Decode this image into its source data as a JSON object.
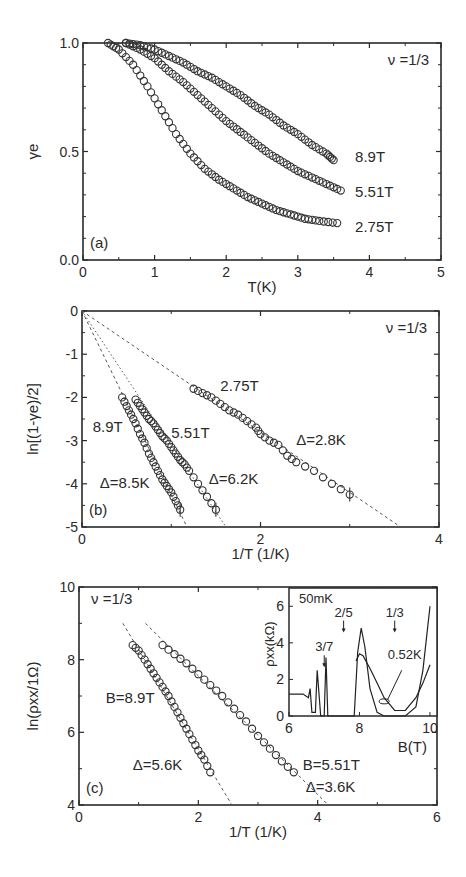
{
  "chart_data": [
    {
      "panel": "(a)",
      "type": "scatter",
      "title": "",
      "annotation": "ν =1/3",
      "xlabel": "T(K)",
      "ylabel": "γe",
      "xlim": [
        0,
        5
      ],
      "ylim": [
        0.0,
        1.0
      ],
      "xticks": [
        "0",
        "1",
        "2",
        "3",
        "4",
        "5"
      ],
      "yticks": [
        "0.0",
        "0.5",
        "1.0"
      ],
      "grid": false,
      "marker": "open-circle",
      "series": [
        {
          "name": "8.9T",
          "x": [
            0.6,
            0.8,
            1.0,
            1.2,
            1.4,
            1.6,
            1.8,
            2.0,
            2.2,
            2.4,
            2.6,
            2.8,
            3.0,
            3.2,
            3.4,
            3.5
          ],
          "y": [
            1.0,
            0.99,
            0.97,
            0.94,
            0.91,
            0.87,
            0.84,
            0.8,
            0.76,
            0.71,
            0.67,
            0.62,
            0.58,
            0.53,
            0.49,
            0.46
          ]
        },
        {
          "name": "5.51T",
          "x": [
            0.6,
            0.8,
            1.0,
            1.2,
            1.4,
            1.6,
            1.8,
            2.0,
            2.2,
            2.4,
            2.6,
            2.8,
            3.0,
            3.2,
            3.4,
            3.6
          ],
          "y": [
            1.0,
            0.97,
            0.93,
            0.87,
            0.82,
            0.76,
            0.7,
            0.64,
            0.59,
            0.54,
            0.49,
            0.45,
            0.41,
            0.38,
            0.35,
            0.32
          ]
        },
        {
          "name": "2.75T",
          "x": [
            0.35,
            0.5,
            0.7,
            0.9,
            1.1,
            1.3,
            1.5,
            1.7,
            1.9,
            2.1,
            2.3,
            2.5,
            2.7,
            2.9,
            3.1,
            3.3,
            3.55
          ],
          "y": [
            1.0,
            0.97,
            0.9,
            0.8,
            0.69,
            0.58,
            0.49,
            0.42,
            0.37,
            0.33,
            0.29,
            0.26,
            0.23,
            0.21,
            0.19,
            0.18,
            0.17
          ]
        }
      ],
      "labels": [
        {
          "text": "8.9T",
          "x": 3.8,
          "y": 0.45
        },
        {
          "text": "5.51T",
          "x": 3.8,
          "y": 0.29
        },
        {
          "text": "2.75T",
          "x": 3.8,
          "y": 0.13
        }
      ],
      "panel_label": "(a)"
    },
    {
      "panel": "(b)",
      "type": "scatter",
      "annotation": "ν =1/3",
      "xlabel": "1/T (1/K)",
      "ylabel": "ln[(1-γe)/2]",
      "xlim": [
        0,
        4
      ],
      "ylim": [
        -5,
        0
      ],
      "xticks": [
        "0",
        "2",
        "4"
      ],
      "yticks": [
        "0",
        "-1",
        "-2",
        "-3",
        "-4",
        "-5"
      ],
      "grid": false,
      "marker": "open-circle",
      "series": [
        {
          "name": "8.9T",
          "x": [
            0.45,
            0.5,
            0.55,
            0.6,
            0.65,
            0.7,
            0.75,
            0.8,
            0.85,
            0.9,
            0.95,
            1.0,
            1.05,
            1.1
          ],
          "y": [
            -2.0,
            -2.2,
            -2.4,
            -2.6,
            -2.85,
            -3.05,
            -3.3,
            -3.5,
            -3.7,
            -3.9,
            -4.05,
            -4.2,
            -4.4,
            -4.6
          ],
          "fit_slope_delta_K": 8.5,
          "fit": "dashed"
        },
        {
          "name": "5.51T",
          "x": [
            0.6,
            0.65,
            0.7,
            0.75,
            0.8,
            0.85,
            0.9,
            0.95,
            1.0,
            1.05,
            1.1,
            1.15,
            1.2,
            1.3,
            1.4,
            1.5
          ],
          "y": [
            -2.05,
            -2.2,
            -2.35,
            -2.5,
            -2.6,
            -2.75,
            -2.9,
            -3.0,
            -3.15,
            -3.3,
            -3.45,
            -3.55,
            -3.7,
            -4.0,
            -4.3,
            -4.6
          ],
          "fit_slope_delta_K": 6.2,
          "fit": "dotted"
        },
        {
          "name": "2.75T",
          "x": [
            1.25,
            1.35,
            1.45,
            1.55,
            1.65,
            1.75,
            1.85,
            1.95,
            2.0,
            2.1,
            2.2,
            2.3,
            2.4,
            2.6,
            2.8,
            3.0
          ],
          "y": [
            -1.8,
            -1.9,
            -2.0,
            -2.15,
            -2.3,
            -2.4,
            -2.55,
            -2.7,
            -2.85,
            -3.0,
            -3.1,
            -3.35,
            -3.5,
            -3.7,
            -4.0,
            -4.25
          ],
          "fit_slope_delta_K": 2.8,
          "fit": "dashed"
        }
      ],
      "labels": [
        {
          "text": "2.75T",
          "x": 1.55,
          "y": -1.85
        },
        {
          "text": "8.9T",
          "x": 0.12,
          "y": -2.8
        },
        {
          "text": "5.51T",
          "x": 1.0,
          "y": -2.95
        },
        {
          "text": "Δ=2.8K",
          "x": 2.4,
          "y": -3.1
        },
        {
          "text": "Δ=6.2K",
          "x": 1.42,
          "y": -4.0
        },
        {
          "text": "Δ=8.5K",
          "x": 0.2,
          "y": -4.1
        }
      ],
      "panel_label": "(b)"
    },
    {
      "panel": "(c)",
      "type": "scatter",
      "annotation": "ν =1/3",
      "xlabel": "1/T (1/K)",
      "ylabel": "ln(ρxx/1Ω)",
      "xlim": [
        0,
        6
      ],
      "ylim": [
        4,
        10
      ],
      "xticks": [
        "0",
        "2",
        "4",
        "6"
      ],
      "yticks": [
        "4",
        "6",
        "8",
        "10"
      ],
      "grid": false,
      "marker": "open-circle",
      "series": [
        {
          "name": "B=8.9T",
          "x": [
            0.9,
            1.0,
            1.1,
            1.2,
            1.3,
            1.4,
            1.5,
            1.6,
            1.7,
            1.8,
            1.9,
            2.0,
            2.1,
            2.2
          ],
          "y": [
            8.4,
            8.25,
            8.0,
            7.75,
            7.5,
            7.25,
            7.0,
            6.7,
            6.4,
            6.1,
            5.8,
            5.5,
            5.25,
            4.9
          ],
          "fit_slope_delta_K": 5.6
        },
        {
          "name": "B=5.51T",
          "x": [
            1.4,
            1.6,
            1.8,
            2.0,
            2.2,
            2.4,
            2.6,
            2.8,
            3.0,
            3.2,
            3.4,
            3.6
          ],
          "y": [
            8.4,
            8.15,
            7.9,
            7.6,
            7.3,
            7.0,
            6.65,
            6.3,
            5.9,
            5.55,
            5.2,
            4.9
          ],
          "fit_slope_delta_K": 3.6
        }
      ],
      "labels": [
        {
          "text": "B=8.9T",
          "x": 0.45,
          "y": 6.8
        },
        {
          "text": "Δ=5.6K",
          "x": 0.9,
          "y": 4.95
        },
        {
          "text": "B=5.51T",
          "x": 3.75,
          "y": 4.95
        },
        {
          "text": "Δ=3.6K",
          "x": 3.8,
          "y": 4.35
        }
      ],
      "panel_label": "(c)",
      "inset": {
        "type": "line",
        "xlabel": "B(T)",
        "ylabel": "ρxx(kΩ)",
        "xlim": [
          6,
          10.2
        ],
        "ylim": [
          0,
          7
        ],
        "xticks": [
          "6",
          "8",
          "10"
        ],
        "yticks": [
          "0",
          "2",
          "4",
          "6"
        ],
        "annotation": "50mK",
        "fraction_labels": [
          {
            "text": "3/7",
            "x": 7.0,
            "y": 3.1
          },
          {
            "text": "2/5",
            "x": 7.55,
            "y": 5.0
          },
          {
            "text": "1/3",
            "x": 9.0,
            "y": 5.0
          }
        ],
        "curve_label": "0.52K",
        "series": [
          {
            "name": "50mK",
            "x": [
              6.0,
              6.4,
              6.55,
              6.6,
              6.65,
              6.75,
              6.8,
              6.9,
              7.0,
              7.05,
              7.1,
              7.2,
              7.5,
              7.85,
              7.95,
              8.05,
              8.15,
              8.3,
              8.5,
              8.7,
              9.0,
              9.3,
              9.6,
              9.8,
              10.0
            ],
            "y": [
              1.2,
              1.2,
              1.0,
              1.5,
              0.2,
              0.2,
              2.5,
              0.0,
              0.0,
              3.2,
              0.0,
              0.0,
              0.0,
              0.0,
              3.5,
              4.8,
              3.8,
              1.5,
              0.2,
              0.0,
              0.0,
              0.0,
              0.5,
              2.5,
              6.0
            ]
          },
          {
            "name": "0.52K",
            "x": [
              7.9,
              8.0,
              8.1,
              8.3,
              8.5,
              8.7,
              9.0,
              9.3,
              9.6,
              9.8,
              10.0
            ],
            "y": [
              3.0,
              3.4,
              3.3,
              2.6,
              1.8,
              1.0,
              0.3,
              0.3,
              1.0,
              1.8,
              2.8
            ]
          }
        ]
      }
    }
  ]
}
